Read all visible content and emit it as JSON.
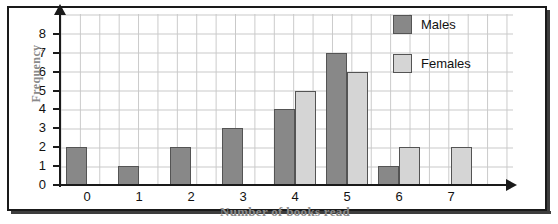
{
  "chart_data": {
    "type": "bar",
    "title": "",
    "xlabel": "Number of books read",
    "ylabel": "Frequency",
    "categories": [
      "0",
      "1",
      "2",
      "3",
      "4",
      "5",
      "6",
      "7"
    ],
    "series": [
      {
        "name": "Males",
        "color": "#888888",
        "values": [
          2,
          1,
          2,
          3,
          4,
          7,
          1,
          0
        ]
      },
      {
        "name": "Females",
        "color": "#d5d5d5",
        "values": [
          0,
          0,
          0,
          0,
          5,
          6,
          2,
          2
        ]
      }
    ],
    "ylim": [
      0,
      8
    ],
    "yticks": [
      "0",
      "1",
      "2",
      "3",
      "4",
      "5",
      "6",
      "7",
      "8"
    ],
    "xticks": [
      "0",
      "1",
      "2",
      "3",
      "4",
      "5",
      "6",
      "7"
    ],
    "grid": true,
    "legend_position": "top-right",
    "legend": [
      "Males",
      "Females"
    ]
  },
  "axis": {
    "y_label": "Frequency",
    "x_label": "Number of books read"
  },
  "legend": {
    "males_label": "Males",
    "females_label": "Females"
  }
}
